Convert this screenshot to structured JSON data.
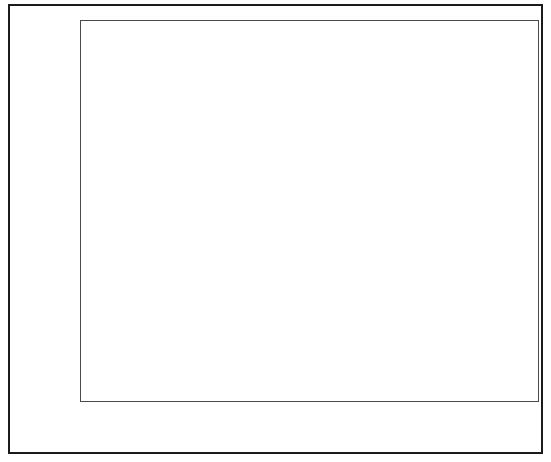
{
  "chart_data": {
    "type": "scatter",
    "title": "",
    "xlabel": "Concrete floor surface contamination by DU, mg cm-2",
    "xlabel_base": "Concrete floor surface contamination by DU, mg cm",
    "xlabel_exponent": "-2",
    "ylabel": "Probability",
    "xscale": "log",
    "yscale": "probability",
    "xlim": [
      0.001,
      10
    ],
    "ylim": [
      0.01,
      0.99
    ],
    "grid": true,
    "legend": null,
    "xticks": [
      "0.001",
      "0.01",
      "0.1",
      "1",
      "10"
    ],
    "xtick_values": [
      0.001,
      0.01,
      0.1,
      1,
      10
    ],
    "yticks": [
      "0.99",
      "0.95",
      "0.90",
      "0.70",
      "0.50",
      "0.30",
      "0.10"
    ],
    "ytick_values": [
      0.99,
      0.95,
      0.9,
      0.7,
      0.5,
      0.3,
      0.1
    ],
    "marker": "filled-circle",
    "marker_color": "#101010",
    "points": [
      {
        "x": 0.0073,
        "y": 0.055
      },
      {
        "x": 0.029,
        "y": 0.16
      },
      {
        "x": 0.031,
        "y": 0.26
      },
      {
        "x": 0.0335,
        "y": 0.355
      },
      {
        "x": 0.034,
        "y": 0.46
      },
      {
        "x": 0.039,
        "y": 0.555
      },
      {
        "x": 0.064,
        "y": 0.65
      },
      {
        "x": 0.083,
        "y": 0.74
      },
      {
        "x": 0.29,
        "y": 0.835
      },
      {
        "x": 3.4,
        "y": 0.948
      }
    ]
  },
  "figure": {
    "background_color": "#ffffff",
    "border_color": "#1b1b1b",
    "axis_color": "#4a4a4a",
    "grid_color": "#ececec"
  }
}
